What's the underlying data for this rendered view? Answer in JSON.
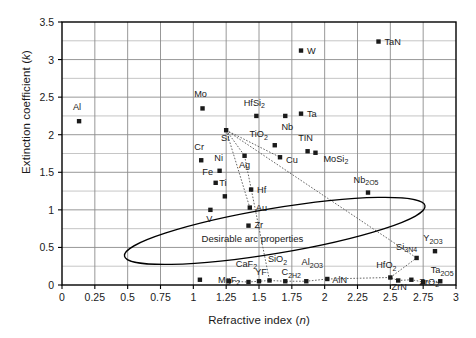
{
  "axes": {
    "x_label_main": "Refractive index (",
    "x_label_sym": "n",
    "x_label_end": ")",
    "y_label_main": "Extinction coefficient (",
    "y_label_sym": "k",
    "y_label_end": ")",
    "x_ticks": [
      "0",
      "0.25",
      "0.5",
      "0.75",
      "1",
      "1.25",
      "1.5",
      "1.75",
      "2",
      "2.25",
      "2.5",
      "2.75",
      "3"
    ],
    "y_ticks": [
      "0",
      "0.5",
      "1",
      "1.5",
      "2",
      "2.5",
      "3",
      "3.5"
    ]
  },
  "annotations": {
    "ellipse_label": "Desirable arc properties"
  },
  "colors": {
    "frame": "#000000",
    "gridline": "#8c8c8c",
    "marker": "#1a1a1a",
    "ellipse": "#000000",
    "connector": "#555555"
  },
  "chart_data": {
    "type": "scatter",
    "title": "",
    "xlabel": "Refractive index (n)",
    "ylabel": "Extinction coefficient (k)",
    "xlim": [
      0,
      3
    ],
    "ylim": [
      0,
      3.5
    ],
    "xticks": [
      0,
      0.25,
      0.5,
      0.75,
      1,
      1.25,
      1.5,
      1.75,
      2,
      2.25,
      2.5,
      2.75,
      3
    ],
    "yticks": [
      0,
      0.5,
      1,
      1.5,
      2,
      2.5,
      3,
      3.5
    ],
    "minor_y_step": 0.25,
    "grid": true,
    "legend": "none",
    "marker": "filled-square",
    "points": [
      {
        "label": "Al",
        "x": 0.13,
        "y": 2.18,
        "lx": -2,
        "ly": -11,
        "anchor": "middle"
      },
      {
        "label": "Mo",
        "x": 1.07,
        "y": 2.35,
        "lx": -2,
        "ly": -11,
        "anchor": "middle"
      },
      {
        "label": "W",
        "x": 1.82,
        "y": 3.12,
        "lx": 6,
        "ly": 3.5,
        "anchor": "start"
      },
      {
        "label": "TaN",
        "x": 2.41,
        "y": 3.24,
        "lx": 6,
        "ly": 3.5,
        "anchor": "start"
      },
      {
        "label": "HfSi",
        "sub": "2",
        "x": 1.48,
        "y": 2.25,
        "lx": -2,
        "ly": -10,
        "anchor": "middle"
      },
      {
        "label": "Ta",
        "x": 1.82,
        "y": 2.28,
        "lx": 6,
        "ly": 3.5,
        "anchor": "start"
      },
      {
        "label": "Nb",
        "x": 1.7,
        "y": 2.25,
        "lx": 2,
        "ly": 14,
        "anchor": "middle"
      },
      {
        "label": "Si",
        "x": 1.25,
        "y": 2.06,
        "lx": -1,
        "ly": 11,
        "anchor": "middle"
      },
      {
        "label": "Cr",
        "x": 1.06,
        "y": 1.66,
        "lx": -2,
        "ly": -10,
        "anchor": "middle"
      },
      {
        "label": "Ni",
        "x": 1.2,
        "y": 1.52,
        "lx": -1,
        "ly": -10,
        "anchor": "middle"
      },
      {
        "label": "Ag",
        "x": 1.39,
        "y": 1.72,
        "lx": 0,
        "ly": 12,
        "anchor": "middle"
      },
      {
        "label": "Cu",
        "x": 1.66,
        "y": 1.7,
        "lx": 6,
        "ly": 6,
        "anchor": "start"
      },
      {
        "label": "TiO",
        "sub": "2",
        "x": 1.62,
        "y": 1.86,
        "lx": -16,
        "ly": -8,
        "anchor": "middle"
      },
      {
        "label": "TIN",
        "x": 1.87,
        "y": 1.78,
        "lx": -2,
        "ly": -10,
        "anchor": "middle"
      },
      {
        "label": "MoSi",
        "sub": "2",
        "x": 1.93,
        "y": 1.76,
        "lx": 8,
        "ly": 9,
        "anchor": "start"
      },
      {
        "label": "Fe",
        "x": 1.17,
        "y": 1.36,
        "lx": -8,
        "ly": -8,
        "anchor": "middle"
      },
      {
        "label": "Ti",
        "x": 1.24,
        "y": 1.18,
        "lx": -2,
        "ly": -10,
        "anchor": "middle"
      },
      {
        "label": "Hf",
        "x": 1.44,
        "y": 1.27,
        "lx": 6,
        "ly": 3.5,
        "anchor": "start"
      },
      {
        "label": "Au",
        "x": 1.43,
        "y": 1.03,
        "lx": 6,
        "ly": 3.5,
        "anchor": "start"
      },
      {
        "label": "V",
        "x": 1.13,
        "y": 1.0,
        "lx": -1,
        "ly": 12,
        "anchor": "middle"
      },
      {
        "label": "Zr",
        "x": 1.42,
        "y": 0.79,
        "lx": 6,
        "ly": 2,
        "anchor": "start"
      },
      {
        "label": "Nb",
        "sub": "2O5",
        "x": 2.33,
        "y": 1.23,
        "lx": -2,
        "ly": -10,
        "anchor": "middle"
      },
      {
        "label": "Y",
        "sub": "2O3",
        "x": 2.84,
        "y": 0.45,
        "lx": -2,
        "ly": -10,
        "anchor": "middle"
      },
      {
        "label": "Si",
        "sub": "3N4",
        "x": 2.7,
        "y": 0.36,
        "lx": -10,
        "ly": -8,
        "anchor": "middle"
      },
      {
        "label": "MgF",
        "sub": "2",
        "x": 1.05,
        "y": 0.07,
        "lx": 18,
        "ly": 3,
        "anchor": "start"
      },
      {
        "label": "CaF",
        "sub": "2",
        "x": 1.42,
        "y": 0.04,
        "lx": -2,
        "ly": -15,
        "anchor": "middle"
      },
      {
        "label": "YF",
        "x": 1.5,
        "y": 0.05,
        "lx": 2,
        "ly": -6,
        "anchor": "middle"
      },
      {
        "label": "SiO",
        "sub": "2",
        "x": 1.58,
        "y": 0.06,
        "lx": 8,
        "ly": -18,
        "anchor": "middle"
      },
      {
        "label": "C",
        "sub": "2H2",
        "x": 1.7,
        "y": 0.05,
        "lx": 6,
        "ly": -6,
        "anchor": "middle"
      },
      {
        "label": "Al",
        "sub": "2O3",
        "x": 1.86,
        "y": 0.05,
        "lx": 6,
        "ly": -16,
        "anchor": "middle"
      },
      {
        "label": "AlN",
        "x": 2.02,
        "y": 0.08,
        "lx": 5,
        "ly": 4,
        "anchor": "start"
      },
      {
        "label": "HfO",
        "sub": "2",
        "x": 2.5,
        "y": 0.1,
        "lx": -4,
        "ly": -9,
        "anchor": "middle"
      },
      {
        "label": "ZrN",
        "x": 2.56,
        "y": 0.06,
        "lx": 1,
        "ly": 10,
        "anchor": "middle"
      },
      {
        "label": "ZrO",
        "sub": "2",
        "x": 2.66,
        "y": 0.07,
        "lx": 8,
        "ly": 5,
        "anchor": "start"
      },
      {
        "label": "Ta",
        "sub": "2O5",
        "x": 2.88,
        "y": 0.05,
        "lx": 2,
        "ly": -8,
        "anchor": "middle"
      },
      {
        "label": "",
        "x": 1.27,
        "y": 0.05,
        "lx": 0,
        "ly": 0,
        "anchor": "middle"
      },
      {
        "label": "",
        "x": 2.75,
        "y": 0.04,
        "lx": 0,
        "ly": 0,
        "anchor": "middle"
      }
    ],
    "ellipse": {
      "cx": 1.62,
      "cy": 0.72,
      "rx": 1.16,
      "ry": 0.3,
      "rotation_deg": -9.5,
      "label": "Desirable arc properties",
      "label_x": 1.45,
      "label_y": 0.57
    },
    "connectors": [
      {
        "name": "si-fan-1",
        "points": [
          [
            1.25,
            2.06
          ],
          [
            1.66,
            1.7
          ]
        ]
      },
      {
        "name": "si-fan-2",
        "points": [
          [
            1.25,
            2.06
          ],
          [
            2.7,
            0.36
          ]
        ]
      },
      {
        "name": "si-fan-3",
        "points": [
          [
            1.25,
            2.06
          ],
          [
            1.43,
            1.03
          ]
        ]
      },
      {
        "name": "si-fan-4",
        "points": [
          [
            1.25,
            2.06
          ],
          [
            1.39,
            1.72
          ]
        ]
      },
      {
        "name": "si-drop",
        "points": [
          [
            1.39,
            1.72
          ],
          [
            1.58,
            0.06
          ]
        ]
      },
      {
        "name": "bottom-chain",
        "points": [
          [
            1.27,
            0.05
          ],
          [
            1.42,
            0.04
          ],
          [
            1.5,
            0.05
          ],
          [
            1.58,
            0.06
          ],
          [
            1.7,
            0.05
          ],
          [
            1.86,
            0.05
          ],
          [
            2.02,
            0.08
          ],
          [
            2.5,
            0.1
          ],
          [
            2.56,
            0.06
          ],
          [
            2.66,
            0.07
          ],
          [
            2.75,
            0.04
          ],
          [
            2.88,
            0.05
          ]
        ]
      },
      {
        "name": "hfo-to-si3n4",
        "points": [
          [
            2.5,
            0.1
          ],
          [
            2.7,
            0.36
          ]
        ]
      }
    ]
  }
}
